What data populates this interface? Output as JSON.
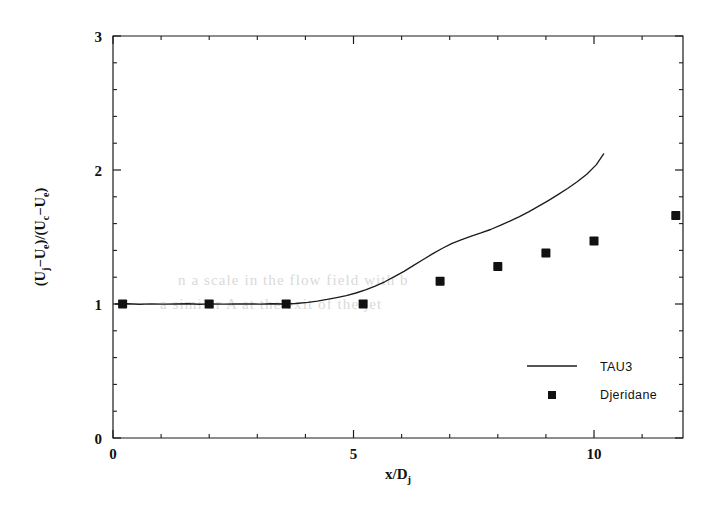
{
  "figure": {
    "background_color": "#ffffff",
    "ink_color": "#111111"
  },
  "chart_data": {
    "type": "line",
    "title": "",
    "subtitle": "",
    "xlabel": "x/D_j",
    "xlabel_parts": {
      "main": "x/D",
      "sub": "j"
    },
    "ylabel": "(U_j-U_e)/(U_c-U_e)",
    "ylabel_parts": [
      {
        "main": "(U",
        "sub": "j"
      },
      {
        "main": "−U",
        "sub": "e"
      },
      {
        "main": ")/(U",
        "sub": "c"
      },
      {
        "main": "−U",
        "sub": "e"
      },
      {
        "main": ")",
        "sub": ""
      }
    ],
    "xlim": [
      0,
      11.85
    ],
    "ylim": [
      0,
      3
    ],
    "xticks": [
      0,
      5,
      10
    ],
    "xtick_labels": [
      "0",
      "5",
      "10"
    ],
    "yticks": [
      0,
      1,
      2,
      3
    ],
    "ytick_labels": [
      "0",
      "1",
      "2",
      "3"
    ],
    "x_minor_interval": 1,
    "y_minor_interval": 0.2,
    "grid": false,
    "frame": "box",
    "legend_position": "lower right",
    "series": [
      {
        "name": "TAU3",
        "style": "line",
        "marker": "none",
        "color": "#1c1c1c",
        "x": [
          0.05,
          0.3,
          0.55,
          0.8,
          1.05,
          1.3,
          1.55,
          1.8,
          2.05,
          2.3,
          2.55,
          2.8,
          3.05,
          3.3,
          3.55,
          3.8,
          4.05,
          4.25,
          4.45,
          4.65,
          4.85,
          5.05,
          5.25,
          5.45,
          5.65,
          5.85,
          6.05,
          6.25,
          6.45,
          6.65,
          6.85,
          7.05,
          7.25,
          7.45,
          7.65,
          7.85,
          8.05,
          8.25,
          8.45,
          8.65,
          8.85,
          9.05,
          9.25,
          9.45,
          9.65,
          9.85,
          10.05,
          10.2
        ],
        "y": [
          1.0,
          1.002,
          0.998,
          1.001,
          0.999,
          1.0,
          1.002,
          0.998,
          1.001,
          0.999,
          1.0,
          1.001,
          0.999,
          1.002,
          1.0,
          1.004,
          1.012,
          1.022,
          1.034,
          1.048,
          1.062,
          1.082,
          1.106,
          1.134,
          1.166,
          1.204,
          1.244,
          1.288,
          1.332,
          1.376,
          1.416,
          1.452,
          1.48,
          1.506,
          1.53,
          1.556,
          1.586,
          1.618,
          1.652,
          1.69,
          1.73,
          1.772,
          1.816,
          1.862,
          1.912,
          1.968,
          2.04,
          2.12
        ]
      },
      {
        "name": "Djeridane",
        "style": "scatter",
        "marker": "square",
        "color": "#111111",
        "x": [
          0.2,
          2.0,
          3.6,
          5.2,
          6.8,
          8.0,
          9.0,
          10.0,
          11.7
        ],
        "y": [
          1.0,
          1.0,
          1.0,
          1.0,
          1.17,
          1.28,
          1.38,
          1.47,
          1.66
        ]
      }
    ],
    "legend": [
      {
        "label": "TAU3",
        "marker": "line"
      },
      {
        "label": "Djeridane",
        "marker": "square"
      }
    ]
  },
  "ghost_text": {
    "line1": "n  a  scale  in  the  flow  field  with  b",
    "line2": "a similar  A  at  the  exit  of  the  jet  ",
    "line3": "",
    "line4": "",
    "line5": "",
    "line6": ""
  }
}
